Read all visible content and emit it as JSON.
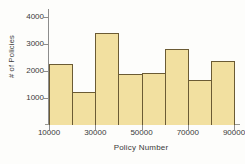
{
  "chart_data": {
    "type": "bar",
    "title": "",
    "xlabel": "Policy Number",
    "ylabel": "# of Policies",
    "categories": [
      "10000",
      "20000",
      "30000",
      "40000",
      "50000",
      "60000",
      "70000",
      "80000"
    ],
    "bin_edges": [
      10000,
      20000,
      30000,
      40000,
      50000,
      60000,
      70000,
      80000,
      90000
    ],
    "values": [
      2280,
      1210,
      3400,
      1880,
      1920,
      2830,
      1670,
      2360
    ],
    "xlim": [
      10000,
      90000
    ],
    "ylim": [
      0,
      4300
    ],
    "xticks": [
      "10000",
      "30000",
      "50000",
      "70000",
      "90000"
    ],
    "xtick_values": [
      10000,
      30000,
      50000,
      70000,
      90000
    ],
    "yticks": [
      "1000",
      "2000",
      "3000",
      "4000"
    ],
    "ytick_values": [
      1000,
      2000,
      3000,
      4000
    ],
    "grid": false,
    "legend": false,
    "colors": {
      "bar_fill": "#F2E0A0",
      "bar_border": "#6B5B34",
      "axis": "#8D8D8D",
      "text": "#3A3A3A",
      "background": "#FDFDFB"
    }
  }
}
